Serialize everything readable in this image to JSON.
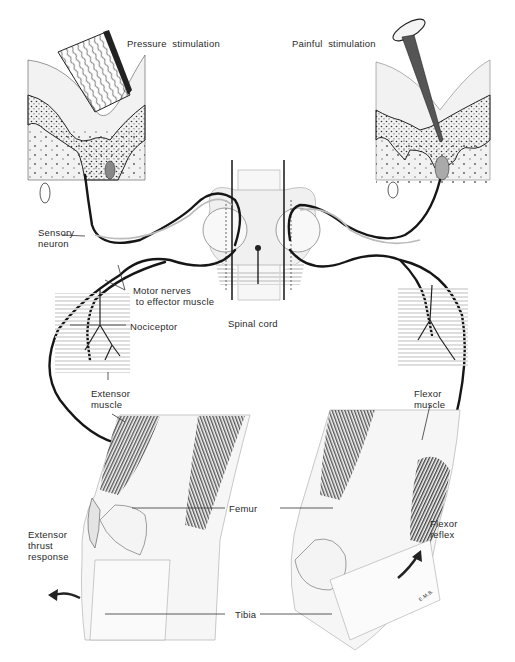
{
  "labels": {
    "pressure": "Pressure  stimulation",
    "painful": "Painful  stimulation",
    "sensory_neuron": "Sensory\nneuron",
    "motor_nerves": "Motor nerves\n to effector muscle",
    "spinal_cord": "Spinal cord",
    "nociceptor": "Nociceptor",
    "extensor_muscle": "Extensor\nmuscle",
    "flexor_muscle": "Flexor\nmuscle",
    "femur": "Femur",
    "tibia": "Tibia",
    "extensor_thrust": "Extensor\nthrust\nresponse",
    "flexor_reflex": "Flexor\nreflex",
    "signature": "E.M.B."
  },
  "colors": {
    "ink": "#1e1e1e",
    "nerve": "#161616",
    "shade": "#d9d9d9",
    "light_shade": "#eeeeee"
  }
}
